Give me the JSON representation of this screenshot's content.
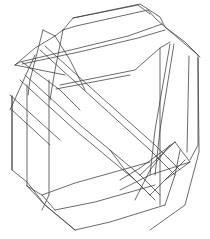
{
  "figure": {
    "type": "wireframe-line-drawing",
    "width": 210,
    "height": 239,
    "stroke_color": "#3a3a3a",
    "background": "#ffffff"
  },
  "paths": {
    "outer_silhouette": [
      [
        [
          73,
          18
        ],
        [
          140,
          4
        ],
        [
          160,
          17
        ],
        [
          165,
          27
        ],
        [
          198,
          55
        ],
        [
          199,
          152
        ],
        [
          185,
          205
        ],
        [
          150,
          230
        ]
      ],
      [
        [
          12,
          96
        ],
        [
          12,
          170
        ],
        [
          27,
          182
        ],
        [
          45,
          205
        ],
        [
          75,
          230
        ]
      ]
    ],
    "top_prism_faces": [
      [
        [
          63,
          30
        ],
        [
          73,
          18
        ],
        [
          138,
          5
        ],
        [
          150,
          14
        ]
      ],
      [
        [
          63,
          30
        ],
        [
          76,
          26
        ],
        [
          148,
          10
        ],
        [
          155,
          18
        ],
        [
          165,
          27
        ],
        [
          185,
          42
        ],
        [
          200,
          57
        ]
      ],
      [
        [
          15,
          65
        ],
        [
          20,
          62
        ],
        [
          79,
          48
        ],
        [
          128,
          36
        ],
        [
          162,
          24
        ]
      ],
      [
        [
          22,
          64
        ],
        [
          79,
          52
        ],
        [
          138,
          38
        ],
        [
          165,
          30
        ]
      ],
      [
        [
          60,
          85
        ],
        [
          135,
          70
        ],
        [
          160,
          48
        ],
        [
          170,
          42
        ]
      ],
      [
        [
          56,
          89
        ],
        [
          130,
          75
        ]
      ]
    ],
    "right_vertical_edges": [
      [
        [
          160,
          48
        ],
        [
          160,
          205
        ]
      ],
      [
        [
          170,
          44
        ],
        [
          155,
          130
        ],
        [
          150,
          175
        ]
      ],
      [
        [
          174,
          44
        ],
        [
          160,
          130
        ],
        [
          155,
          175
        ]
      ],
      [
        [
          189,
          56
        ],
        [
          187,
          152
        ]
      ],
      [
        [
          198,
          58
        ],
        [
          198,
          145
        ],
        [
          190,
          160
        ]
      ]
    ],
    "left_vertical_edges": [
      [
        [
          12,
          96
        ],
        [
          12,
          170
        ]
      ],
      [
        [
          27,
          85
        ],
        [
          27,
          186
        ]
      ],
      [
        [
          49,
          80
        ],
        [
          49,
          195
        ]
      ],
      [
        [
          27,
          186
        ],
        [
          42,
          195
        ],
        [
          55,
          210
        ]
      ],
      [
        [
          49,
          195
        ],
        [
          42,
          210
        ]
      ]
    ],
    "bottom_prism_faces": [
      [
        [
          42,
          195
        ],
        [
          75,
          183
        ],
        [
          150,
          162
        ]
      ],
      [
        [
          55,
          210
        ],
        [
          95,
          202
        ],
        [
          155,
          185
        ]
      ],
      [
        [
          75,
          230
        ],
        [
          110,
          222
        ],
        [
          165,
          205
        ]
      ],
      [
        [
          27,
          186
        ],
        [
          45,
          205
        ],
        [
          75,
          230
        ]
      ]
    ],
    "diagonal_band": [
      [
        [
          40,
          50
        ],
        [
          95,
          100
        ],
        [
          150,
          150
        ],
        [
          175,
          175
        ]
      ],
      [
        [
          45,
          46
        ],
        [
          100,
          96
        ],
        [
          155,
          145
        ],
        [
          180,
          170
        ]
      ],
      [
        [
          25,
          75
        ],
        [
          80,
          125
        ],
        [
          140,
          175
        ],
        [
          160,
          195
        ]
      ],
      [
        [
          20,
          80
        ],
        [
          75,
          130
        ],
        [
          135,
          180
        ],
        [
          155,
          200
        ]
      ],
      [
        [
          10,
          95
        ],
        [
          60,
          140
        ]
      ],
      [
        [
          12,
          110
        ],
        [
          50,
          145
        ]
      ]
    ],
    "upper_left_star": [
      [
        [
          43,
          30
        ],
        [
          55,
          36
        ],
        [
          63,
          30
        ]
      ],
      [
        [
          43,
          30
        ],
        [
          30,
          80
        ],
        [
          28,
          95
        ]
      ],
      [
        [
          55,
          36
        ],
        [
          70,
          60
        ],
        [
          85,
          90
        ]
      ],
      [
        [
          15,
          65
        ],
        [
          40,
          70
        ],
        [
          65,
          75
        ]
      ],
      [
        [
          15,
          65
        ],
        [
          35,
          48
        ],
        [
          55,
          36
        ]
      ],
      [
        [
          63,
          30
        ],
        [
          55,
          70
        ],
        [
          50,
          100
        ]
      ],
      [
        [
          22,
          62
        ],
        [
          60,
          90
        ],
        [
          80,
          110
        ]
      ],
      [
        [
          35,
          55
        ],
        [
          10,
          110
        ]
      ]
    ],
    "lower_right_star": [
      [
        [
          175,
          142
        ],
        [
          190,
          162
        ],
        [
          165,
          180
        ]
      ],
      [
        [
          175,
          142
        ],
        [
          140,
          168
        ],
        [
          120,
          180
        ]
      ],
      [
        [
          190,
          162
        ],
        [
          150,
          175
        ],
        [
          120,
          190
        ]
      ],
      [
        [
          150,
          195
        ],
        [
          165,
          180
        ],
        [
          185,
          160
        ]
      ],
      [
        [
          135,
          200
        ],
        [
          150,
          170
        ],
        [
          170,
          145
        ]
      ],
      [
        [
          165,
          205
        ],
        [
          175,
          175
        ],
        [
          180,
          150
        ]
      ],
      [
        [
          150,
          195
        ],
        [
          125,
          170
        ],
        [
          110,
          150
        ]
      ],
      [
        [
          140,
          175
        ],
        [
          175,
          142
        ]
      ]
    ]
  }
}
